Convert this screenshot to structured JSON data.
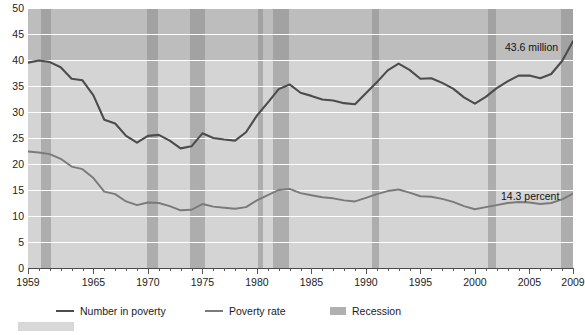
{
  "chart_data": {
    "type": "line",
    "title": "",
    "subtitle": "",
    "xlabel": "",
    "ylabel": "",
    "ylim": [
      0,
      50
    ],
    "xlim": [
      1959,
      2009
    ],
    "grid": true,
    "legend_position": "bottom",
    "yticks": [
      0,
      5,
      10,
      15,
      20,
      25,
      30,
      35,
      40,
      45,
      50
    ],
    "xticks": [
      1959,
      1965,
      1970,
      1975,
      1980,
      1985,
      1990,
      1995,
      2000,
      2005,
      2009
    ],
    "xtick_labels": [
      "1959",
      "1965",
      "1970",
      "1975",
      "1980",
      "1985",
      "1990",
      "1995",
      "2000",
      "2005",
      "2009"
    ],
    "ytick_labels": [
      "0",
      "5",
      "10",
      "15",
      "20",
      "25",
      "30",
      "35",
      "40",
      "45",
      "50"
    ],
    "x": [
      1959,
      1960,
      1961,
      1962,
      1963,
      1964,
      1965,
      1966,
      1967,
      1968,
      1969,
      1970,
      1971,
      1972,
      1973,
      1974,
      1975,
      1976,
      1977,
      1978,
      1979,
      1980,
      1981,
      1982,
      1983,
      1984,
      1985,
      1986,
      1987,
      1988,
      1989,
      1990,
      1991,
      1992,
      1993,
      1994,
      1995,
      1996,
      1997,
      1998,
      1999,
      2000,
      2001,
      2002,
      2003,
      2004,
      2005,
      2006,
      2007,
      2008,
      2009
    ],
    "series": [
      {
        "name": "Number in poverty",
        "unit": "millions",
        "color": "#4c4c4c",
        "values": [
          39.5,
          39.9,
          39.6,
          38.6,
          36.4,
          36.1,
          33.2,
          28.5,
          27.8,
          25.4,
          24.1,
          25.4,
          25.6,
          24.5,
          23.0,
          23.4,
          25.9,
          25.0,
          24.7,
          24.5,
          26.1,
          29.3,
          31.8,
          34.4,
          35.3,
          33.7,
          33.1,
          32.4,
          32.2,
          31.7,
          31.5,
          33.6,
          35.7,
          38.0,
          39.3,
          38.1,
          36.4,
          36.5,
          35.6,
          34.5,
          32.8,
          31.6,
          32.9,
          34.6,
          35.9,
          37.0,
          37.0,
          36.5,
          37.3,
          39.8,
          43.6
        ],
        "end_label": "43.6 million"
      },
      {
        "name": "Poverty rate",
        "unit": "percent",
        "color": "#7a7a7a",
        "values": [
          22.4,
          22.2,
          21.9,
          21.0,
          19.5,
          19.0,
          17.3,
          14.7,
          14.2,
          12.8,
          12.1,
          12.6,
          12.5,
          11.9,
          11.1,
          11.2,
          12.3,
          11.8,
          11.6,
          11.4,
          11.7,
          13.0,
          14.0,
          15.0,
          15.2,
          14.4,
          14.0,
          13.6,
          13.4,
          13.0,
          12.8,
          13.5,
          14.2,
          14.8,
          15.1,
          14.5,
          13.8,
          13.7,
          13.3,
          12.7,
          11.9,
          11.3,
          11.7,
          12.1,
          12.5,
          12.7,
          12.6,
          12.3,
          12.5,
          13.2,
          14.3
        ],
        "end_label": "14.3 percent"
      }
    ],
    "annotations": [
      {
        "text": "43.6 million",
        "x": 2009,
        "y": 43.6
      },
      {
        "text": "14.3 percent",
        "x": 2009,
        "y": 14.3
      }
    ],
    "recessions": [
      {
        "start": 1960.2,
        "end": 1961.1
      },
      {
        "start": 1969.9,
        "end": 1970.9
      },
      {
        "start": 1973.9,
        "end": 1975.2
      },
      {
        "start": 1980.1,
        "end": 1980.6
      },
      {
        "start": 1981.5,
        "end": 1982.9
      },
      {
        "start": 1990.6,
        "end": 1991.2
      },
      {
        "start": 2001.2,
        "end": 2001.9
      },
      {
        "start": 2007.9,
        "end": 2009.5
      }
    ],
    "legend": [
      {
        "label": "Number in poverty",
        "marker": "line",
        "color": "#4c4c4c"
      },
      {
        "label": "Poverty rate",
        "marker": "line",
        "color": "#7a7a7a"
      },
      {
        "label": "Recession",
        "marker": "swatch",
        "color": "#b0b0b0"
      }
    ]
  }
}
